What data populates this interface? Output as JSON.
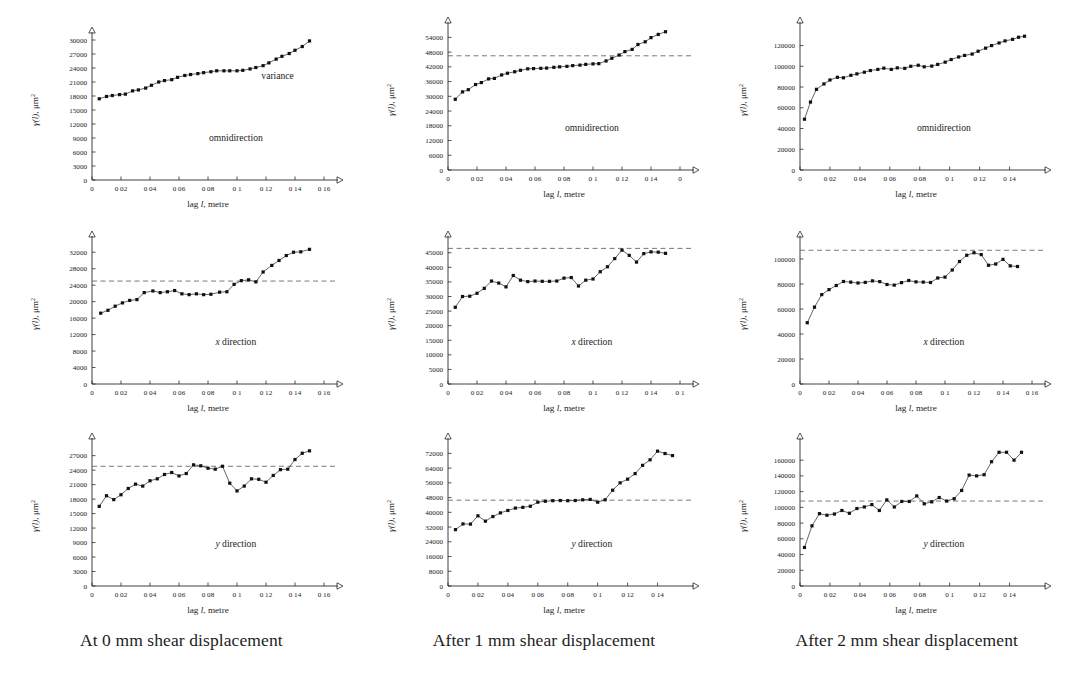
{
  "figure": {
    "captions": [
      "At 0 mm shear displacement",
      "After 1 mm shear displacement",
      "After 2 mm shear displacement"
    ],
    "axis_titles": {
      "x": "lag l, metre",
      "y": "γ(l), μm"
    },
    "y_superscript": "2",
    "annotations": {
      "variance": "variance",
      "omnidirection": "omnidirection",
      "x_direction_prefix": "x",
      "y_direction_prefix": "y",
      "direction_suffix": "direction"
    }
  },
  "chart_data": [
    {
      "id": "panel-r1c1",
      "type": "scatter",
      "title": "",
      "subtitle": "At 0 mm shear displacement",
      "annotation": "omnidirection",
      "variance_label": "variance",
      "xlabel": "lag l, metre",
      "ylabel": "γ(l), μm²",
      "xlim": [
        0,
        0.16
      ],
      "ylim": [
        0,
        30000
      ],
      "xticks": [
        0,
        0.02,
        0.04,
        0.06,
        0.08,
        0.1,
        0.12,
        0.14,
        0.16
      ],
      "xticklabels": [
        "0",
        "0 02",
        "0 04",
        "0 06",
        "0 08",
        "0 1",
        "0 12",
        "0 14",
        "0 16"
      ],
      "yticks": [
        0,
        3000,
        6000,
        9000,
        12000,
        15000,
        18000,
        21000,
        24000,
        27000,
        30000
      ],
      "yticklabels": [
        "0",
        "3000",
        "6000",
        "9000",
        "12000",
        "15000",
        "18000",
        "21000",
        "24000",
        "27000",
        "30000"
      ],
      "variance_line": null,
      "grid": false,
      "x": [
        0.005,
        0.01,
        0.014,
        0.019,
        0.023,
        0.028,
        0.032,
        0.037,
        0.041,
        0.046,
        0.05,
        0.055,
        0.059,
        0.064,
        0.068,
        0.073,
        0.077,
        0.082,
        0.086,
        0.091,
        0.095,
        0.1,
        0.104,
        0.109,
        0.113,
        0.118,
        0.122,
        0.127,
        0.131,
        0.136,
        0.14,
        0.145,
        0.15
      ],
      "y": [
        17400,
        17900,
        18100,
        18300,
        18400,
        19100,
        19300,
        19700,
        20300,
        21000,
        21300,
        21500,
        22000,
        22400,
        22600,
        22800,
        23000,
        23200,
        23400,
        23400,
        23400,
        23400,
        23500,
        23800,
        24100,
        24500,
        25100,
        25900,
        26500,
        27100,
        27800,
        28600,
        29800
      ]
    },
    {
      "id": "panel-r1c2",
      "type": "scatter",
      "title": "",
      "subtitle": "After 1 mm shear displacement",
      "annotation": "omnidirection",
      "xlabel": "lag l, metre",
      "ylabel": "γ(l), μm²",
      "xlim": [
        0,
        0.16
      ],
      "ylim": [
        0,
        57000
      ],
      "xticks": [
        0,
        0.02,
        0.04,
        0.06,
        0.08,
        0.1,
        0.12,
        0.14,
        0.16
      ],
      "xticklabels": [
        "0",
        "0 02",
        "0 04",
        "0 06",
        "0 08",
        "0 1",
        "0 12",
        "0 14",
        "0"
      ],
      "yticks": [
        0,
        6000,
        12000,
        18000,
        24000,
        30000,
        36000,
        42000,
        48000,
        54000
      ],
      "yticklabels": [
        "0",
        "6000",
        "12000",
        "18000",
        "24000",
        "30000",
        "36000",
        "42000",
        "48000",
        "54000"
      ],
      "variance_line": 46500,
      "grid": false,
      "x": [
        0.005,
        0.01,
        0.014,
        0.019,
        0.023,
        0.028,
        0.032,
        0.037,
        0.041,
        0.046,
        0.05,
        0.055,
        0.059,
        0.064,
        0.068,
        0.073,
        0.077,
        0.082,
        0.086,
        0.091,
        0.095,
        0.1,
        0.104,
        0.109,
        0.113,
        0.118,
        0.122,
        0.127,
        0.131,
        0.136,
        0.14,
        0.145,
        0.15
      ],
      "y": [
        28800,
        31800,
        32700,
        34800,
        35600,
        37100,
        37300,
        38700,
        39400,
        40000,
        40600,
        41200,
        41300,
        41400,
        41500,
        41800,
        42000,
        42200,
        42500,
        42700,
        43000,
        43200,
        43300,
        44400,
        45500,
        46800,
        48200,
        49100,
        51100,
        52200,
        53900,
        55200,
        56300
      ]
    },
    {
      "id": "panel-r1c3",
      "type": "scatter",
      "title": "",
      "subtitle": "After 2 mm shear displacement",
      "annotation": "omnidirection",
      "xlabel": "lag l, metre",
      "ylabel": "γ(l), μm²",
      "xlim": [
        0,
        0.155
      ],
      "ylim": [
        0,
        135000
      ],
      "xticks": [
        0,
        0.02,
        0.04,
        0.06,
        0.08,
        0.1,
        0.12,
        0.14
      ],
      "xticklabels": [
        "0",
        "0 02",
        "0 04",
        "0 06",
        "0 08",
        "0 1",
        "0 12",
        "0 14"
      ],
      "yticks": [
        0,
        20000,
        40000,
        60000,
        80000,
        100000,
        120000
      ],
      "yticklabels": [
        "0",
        "20000",
        "40000",
        "60000",
        "80000",
        "100000",
        "120000"
      ],
      "variance_line": null,
      "grid": false,
      "x": [
        0.003,
        0.007,
        0.011,
        0.016,
        0.02,
        0.025,
        0.029,
        0.034,
        0.038,
        0.043,
        0.047,
        0.052,
        0.056,
        0.061,
        0.065,
        0.07,
        0.074,
        0.079,
        0.083,
        0.088,
        0.092,
        0.097,
        0.101,
        0.106,
        0.11,
        0.115,
        0.119,
        0.124,
        0.128,
        0.133,
        0.137,
        0.142,
        0.146,
        0.15
      ],
      "y": [
        49000,
        65500,
        77800,
        83000,
        86800,
        89400,
        88900,
        91300,
        92700,
        94300,
        95900,
        97000,
        98200,
        97000,
        98500,
        98000,
        100000,
        101000,
        99500,
        100200,
        101800,
        104000,
        106500,
        109000,
        110500,
        111800,
        114500,
        117500,
        120000,
        122500,
        124500,
        126000,
        128000,
        129000
      ]
    },
    {
      "id": "panel-r2c1",
      "type": "scatter",
      "title": "",
      "subtitle": "At 0 mm shear displacement",
      "annotation": "x direction",
      "xlabel": "lag l, metre",
      "ylabel": "γ(l), μm²",
      "xlim": [
        0,
        0.16
      ],
      "ylim": [
        0,
        34000
      ],
      "xticks": [
        0,
        0.02,
        0.04,
        0.06,
        0.08,
        0.1,
        0.12,
        0.14,
        0.16
      ],
      "xticklabels": [
        "0",
        "0 02",
        "0 04",
        "0 06",
        "0 08",
        "0 1",
        "0 12",
        "0 14",
        "0 16"
      ],
      "yticks": [
        0,
        4000,
        8000,
        12000,
        16000,
        20000,
        24000,
        28000,
        32000
      ],
      "yticklabels": [
        "0",
        "4000",
        "8000",
        "12000",
        "16000",
        "20000",
        "24000",
        "28000",
        "32000"
      ],
      "variance_line": 25000,
      "grid": false,
      "x": [
        0.006,
        0.011,
        0.016,
        0.021,
        0.026,
        0.031,
        0.036,
        0.042,
        0.047,
        0.052,
        0.057,
        0.062,
        0.067,
        0.072,
        0.077,
        0.082,
        0.088,
        0.093,
        0.098,
        0.103,
        0.108,
        0.113,
        0.118,
        0.124,
        0.129,
        0.134,
        0.139,
        0.144,
        0.15
      ],
      "y": [
        17200,
        17900,
        18900,
        19700,
        20300,
        20500,
        22200,
        22600,
        22200,
        22400,
        22700,
        21900,
        21700,
        21900,
        21700,
        21800,
        22300,
        22400,
        24200,
        25100,
        25300,
        24800,
        27200,
        28800,
        30000,
        31200,
        32000,
        32100,
        32700
      ]
    },
    {
      "id": "panel-r2c2",
      "type": "scatter",
      "title": "",
      "subtitle": "After 1 mm shear displacement",
      "annotation": "x direction",
      "xlabel": "lag l, metre",
      "ylabel": "γ(l), μm²",
      "xlim": [
        0,
        0.16
      ],
      "ylim": [
        0,
        48000
      ],
      "xticks": [
        0,
        0.02,
        0.04,
        0.06,
        0.08,
        0.1,
        0.12,
        0.14,
        0.16
      ],
      "xticklabels": [
        "0",
        "0 02",
        "0 04",
        "0 06",
        "0 08",
        "0 1",
        "0 12",
        "0 14",
        "0 1"
      ],
      "yticks": [
        0,
        5000,
        10000,
        15000,
        20000,
        25000,
        30000,
        35000,
        40000,
        45000
      ],
      "yticklabels": [
        "0",
        "5000",
        "10000",
        "15000",
        "20000",
        "25000",
        "30000",
        "35000",
        "40000",
        "45000"
      ],
      "variance_line": 46500,
      "grid": false,
      "x": [
        0.005,
        0.01,
        0.015,
        0.02,
        0.025,
        0.03,
        0.035,
        0.04,
        0.045,
        0.05,
        0.055,
        0.06,
        0.065,
        0.07,
        0.075,
        0.08,
        0.085,
        0.09,
        0.095,
        0.1,
        0.105,
        0.11,
        0.115,
        0.12,
        0.125,
        0.13,
        0.135,
        0.14,
        0.145,
        0.15
      ],
      "y": [
        26300,
        30000,
        30100,
        31100,
        32800,
        35300,
        34600,
        33300,
        37200,
        35600,
        35100,
        35300,
        35200,
        35200,
        35300,
        36300,
        36500,
        33600,
        35600,
        36000,
        38500,
        40200,
        43000,
        45900,
        44100,
        41800,
        44700,
        45300,
        45200,
        44800
      ]
    },
    {
      "id": "panel-r2c3",
      "type": "scatter",
      "title": "",
      "subtitle": "After 2 mm shear displacement",
      "annotation": "x direction",
      "xlabel": "lag l, metre",
      "ylabel": "γ(l), μm²",
      "xlim": [
        0,
        0.16
      ],
      "ylim": [
        0,
        112000
      ],
      "xticks": [
        0,
        0.02,
        0.04,
        0.06,
        0.08,
        0.1,
        0.12,
        0.14,
        0.16
      ],
      "xticklabels": [
        "0",
        "0 02",
        "0 04",
        "0 06",
        "0 08",
        "0 1",
        "0 12",
        "0 14",
        "0 16"
      ],
      "yticks": [
        0,
        20000,
        40000,
        60000,
        80000,
        100000
      ],
      "yticklabels": [
        "0",
        "20000",
        "40000",
        "60000",
        "80000",
        "100000"
      ],
      "variance_line": 107000,
      "grid": false,
      "x": [
        0.005,
        0.01,
        0.015,
        0.02,
        0.025,
        0.03,
        0.035,
        0.04,
        0.045,
        0.05,
        0.055,
        0.06,
        0.065,
        0.07,
        0.075,
        0.08,
        0.085,
        0.09,
        0.095,
        0.1,
        0.105,
        0.11,
        0.115,
        0.12,
        0.125,
        0.13,
        0.135,
        0.14,
        0.145,
        0.15
      ],
      "y": [
        49000,
        61500,
        71500,
        75500,
        78800,
        82000,
        81500,
        80800,
        81300,
        82500,
        81900,
        79600,
        79100,
        81100,
        82800,
        81700,
        81500,
        81200,
        84800,
        85500,
        91200,
        98000,
        103000,
        105000,
        103500,
        95000,
        96000,
        99700,
        94500,
        94000
      ]
    },
    {
      "id": "panel-r3c1",
      "type": "scatter",
      "title": "",
      "subtitle": "At 0 mm shear displacement",
      "annotation": "y direction",
      "xlabel": "lag l, metre",
      "ylabel": "γ(l), μm²",
      "xlim": [
        0,
        0.16
      ],
      "ylim": [
        0,
        29000
      ],
      "xticks": [
        0,
        0.02,
        0.04,
        0.06,
        0.08,
        0.1,
        0.12,
        0.14,
        0.16
      ],
      "xticklabels": [
        "0",
        "0 02",
        "0 04",
        "0 06",
        "0 08",
        "0 1",
        "0 12",
        "0 14",
        "0 16"
      ],
      "yticks": [
        0,
        3000,
        6000,
        9000,
        12000,
        15000,
        18000,
        21000,
        24000,
        27000
      ],
      "yticklabels": [
        "0",
        "3000",
        "6000",
        "9000",
        "12000",
        "15000",
        "18000",
        "21000",
        "24000",
        "27000"
      ],
      "variance_line": 24800,
      "grid": false,
      "x": [
        0.005,
        0.01,
        0.015,
        0.02,
        0.025,
        0.03,
        0.035,
        0.04,
        0.045,
        0.05,
        0.055,
        0.06,
        0.065,
        0.07,
        0.075,
        0.08,
        0.085,
        0.09,
        0.095,
        0.1,
        0.105,
        0.11,
        0.115,
        0.12,
        0.125,
        0.13,
        0.135,
        0.14,
        0.145,
        0.15
      ],
      "y": [
        16500,
        18700,
        17900,
        18900,
        20200,
        21100,
        20700,
        21800,
        22200,
        23100,
        23500,
        22800,
        23300,
        25100,
        24900,
        24400,
        24200,
        24800,
        21300,
        19700,
        20700,
        22200,
        22100,
        21500,
        22900,
        24100,
        24200,
        26200,
        27500,
        28000
      ]
    },
    {
      "id": "panel-r3c2",
      "type": "scatter",
      "title": "",
      "subtitle": "After 1 mm shear displacement",
      "annotation": "y direction",
      "xlabel": "lag l, metre",
      "ylabel": "γ(l), μm²",
      "xlim": [
        0,
        0.155
      ],
      "ylim": [
        0,
        76000
      ],
      "xticks": [
        0,
        0.02,
        0.04,
        0.06,
        0.08,
        0.1,
        0.12,
        0.14
      ],
      "xticklabels": [
        "0",
        "0 02",
        "0 04",
        "0 06",
        "0 08",
        "0 1",
        "0 12",
        "0 14"
      ],
      "yticks": [
        0,
        8000,
        16000,
        24000,
        32000,
        40000,
        48000,
        56000,
        64000,
        72000
      ],
      "yticklabels": [
        "0",
        "8000",
        "16000",
        "24000",
        "32000",
        "40000",
        "48000",
        "56000",
        "64000",
        "72000"
      ],
      "variance_line": 46600,
      "grid": false,
      "x": [
        0.005,
        0.01,
        0.015,
        0.02,
        0.025,
        0.03,
        0.035,
        0.04,
        0.045,
        0.05,
        0.055,
        0.06,
        0.065,
        0.07,
        0.075,
        0.08,
        0.085,
        0.09,
        0.095,
        0.1,
        0.105,
        0.11,
        0.115,
        0.12,
        0.125,
        0.13,
        0.135,
        0.14,
        0.145,
        0.15
      ],
      "y": [
        30600,
        33700,
        33600,
        38100,
        35200,
        37700,
        39700,
        41000,
        42300,
        42700,
        43300,
        45500,
        46000,
        46300,
        46400,
        46300,
        46400,
        46800,
        47000,
        45500,
        46800,
        52000,
        56000,
        58000,
        61000,
        65500,
        68500,
        73200,
        71900,
        70800
      ]
    },
    {
      "id": "panel-r3c3",
      "type": "scatter",
      "title": "",
      "subtitle": "After 2 mm shear displacement",
      "annotation": "y direction",
      "xlabel": "lag l, metre",
      "ylabel": "γ(l), μm²",
      "xlim": [
        0,
        0.155
      ],
      "ylim": [
        0,
        178000
      ],
      "xticks": [
        0,
        0.02,
        0.04,
        0.06,
        0.08,
        0.1,
        0.12,
        0.14
      ],
      "xticklabels": [
        "0",
        "0 02",
        "0 04",
        "0 06",
        "0 08",
        "0 1",
        "0 12",
        "0 14"
      ],
      "yticks": [
        0,
        20000,
        40000,
        60000,
        80000,
        100000,
        120000,
        140000,
        160000
      ],
      "yticklabels": [
        "0",
        "20000",
        "40000",
        "60000",
        "80000",
        "100000",
        "120000",
        "140000",
        "160000"
      ],
      "variance_line": 108000,
      "grid": false,
      "x": [
        0.003,
        0.008,
        0.013,
        0.018,
        0.023,
        0.028,
        0.033,
        0.038,
        0.043,
        0.048,
        0.053,
        0.058,
        0.063,
        0.068,
        0.073,
        0.078,
        0.083,
        0.088,
        0.093,
        0.098,
        0.103,
        0.108,
        0.113,
        0.118,
        0.123,
        0.128,
        0.133,
        0.138,
        0.143,
        0.148
      ],
      "y": [
        49000,
        76500,
        92000,
        90000,
        91500,
        96000,
        92500,
        98500,
        100500,
        103500,
        96000,
        109500,
        100500,
        107500,
        107500,
        114500,
        104500,
        107000,
        112500,
        108000,
        111000,
        121500,
        141000,
        140000,
        141500,
        158000,
        170000,
        170000,
        160000,
        170000
      ]
    }
  ]
}
